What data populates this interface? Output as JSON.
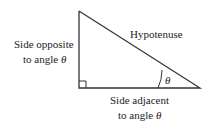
{
  "diagram": {
    "type": "right-triangle",
    "labels": {
      "hypotenuse": "Hypotenuse",
      "opposite_line1": "Side opposite",
      "opposite_line2": "to angle",
      "adjacent_line1": "Side adjacent",
      "adjacent_line2": "to angle",
      "angle_symbol": "θ"
    },
    "colors": {
      "stroke": "#333333",
      "text": "#222222"
    }
  }
}
